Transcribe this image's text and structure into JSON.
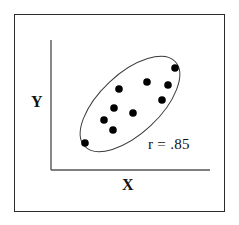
{
  "figure": {
    "background_color": "#ffffff",
    "frame_color": "#2b2b2b"
  },
  "axes": {
    "y_label": "Y",
    "x_label": "X",
    "axis_color": "#555555",
    "x_axis": {
      "x1": 51,
      "y1": 170,
      "x2": 210,
      "y2": 170
    },
    "y_axis": {
      "x1": 51,
      "y1": 40,
      "x2": 51,
      "y2": 170
    }
  },
  "annotation": {
    "correlation_label": "r = .85"
  },
  "chart_data": {
    "type": "scatter",
    "title": "",
    "xlabel": "X",
    "ylabel": "Y",
    "xlim": [
      0,
      100
    ],
    "ylim": [
      0,
      100
    ],
    "grid": false,
    "legend": "none",
    "correlation": 0.85,
    "correlation_label": "r = .85",
    "point_color": "#000000",
    "point_radius_px": 3.8,
    "ellipse": {
      "center_x_px": 130,
      "center_y_px": 104,
      "radius_major_px": 62,
      "radius_minor_px": 30,
      "rotation_deg": -43,
      "stroke_color": "#3a3a3a",
      "stroke_width_px": 1,
      "fill": "none"
    },
    "points_px": [
      {
        "x": 175,
        "y": 68
      },
      {
        "x": 147,
        "y": 82
      },
      {
        "x": 168,
        "y": 85
      },
      {
        "x": 119,
        "y": 89
      },
      {
        "x": 162,
        "y": 100
      },
      {
        "x": 114,
        "y": 108
      },
      {
        "x": 133,
        "y": 113
      },
      {
        "x": 104,
        "y": 120
      },
      {
        "x": 113,
        "y": 130
      },
      {
        "x": 85,
        "y": 143
      }
    ],
    "x": [
      82,
      60,
      77,
      38,
      73,
      34,
      49,
      26,
      33,
      12
    ],
    "y": [
      79,
      69,
      67,
      64,
      54,
      48,
      44,
      39,
      31,
      21
    ]
  }
}
